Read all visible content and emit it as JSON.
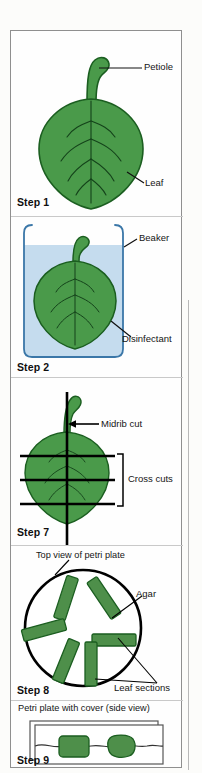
{
  "figure": {
    "copyright": "Copyright © 2015 Cengage Learning®"
  },
  "panels": [
    {
      "id": "step1",
      "step_label": "Step 1",
      "callouts": [
        {
          "name": "petiole",
          "text": "Petiole"
        },
        {
          "name": "leaf",
          "text": "Leaf"
        }
      ]
    },
    {
      "id": "step2",
      "step_label": "Step 2",
      "callouts": [
        {
          "name": "beaker",
          "text": "Beaker"
        },
        {
          "name": "disinfectant",
          "text": "Disinfectant"
        }
      ]
    },
    {
      "id": "step7",
      "step_label": "Step 7",
      "callouts": [
        {
          "name": "midrib-cut",
          "text": "Midrib cut"
        },
        {
          "name": "cross-cuts",
          "text": "Cross cuts"
        }
      ]
    },
    {
      "id": "step8",
      "step_label": "Step 8",
      "caption": "Top view of petri plate",
      "callouts": [
        {
          "name": "agar",
          "text": "Agar"
        },
        {
          "name": "leaf-sections",
          "text": "Leaf sections"
        }
      ]
    },
    {
      "id": "step9",
      "step_label": "Step 9",
      "caption": "Petri plate with cover (side view)"
    }
  ],
  "colors": {
    "leaf_green": "#4a9a4a",
    "leaf_outline": "#1b5e20",
    "section_green": "#4e8f4a",
    "liquid_blue": "#c5dcee",
    "beaker_outline": "#3b77a8",
    "ink": "#101010"
  }
}
